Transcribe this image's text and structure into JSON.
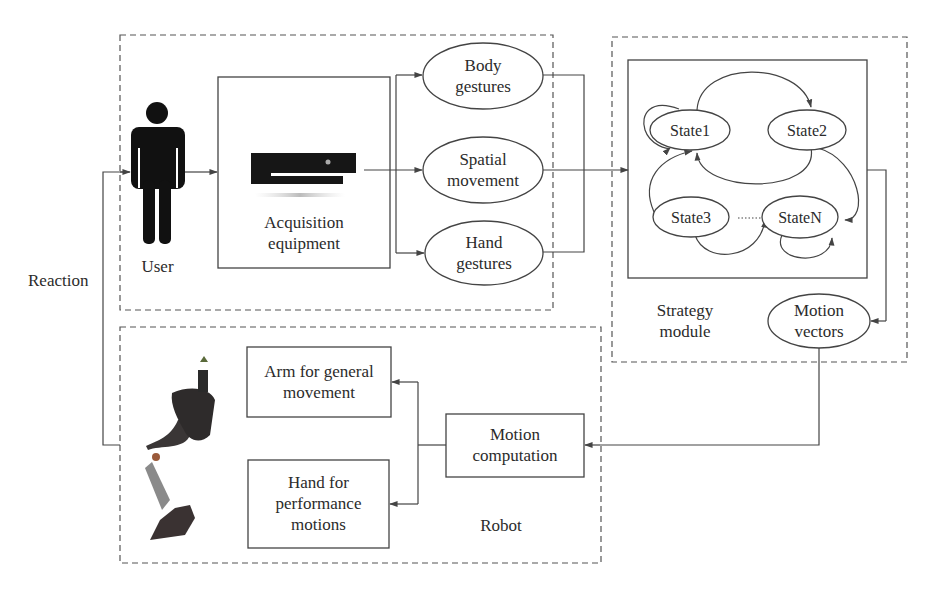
{
  "diagram": {
    "input_group": {
      "user_label": "User",
      "acquisition_label_line1": "Acquisition",
      "acquisition_label_line2": "equipment",
      "features": [
        {
          "line1": "Body",
          "line2": "gestures"
        },
        {
          "line1": "Spatial",
          "line2": "movement"
        },
        {
          "line1": "Hand",
          "line2": "gestures"
        }
      ]
    },
    "strategy_group": {
      "states": [
        "State1",
        "State2",
        "State3",
        "StateN"
      ],
      "ellipsis": "......",
      "label_line1": "Strategy",
      "label_line2": "module",
      "output_line1": "Motion",
      "output_line2": "vectors"
    },
    "robot_group": {
      "arm_line1": "Arm for general",
      "arm_line2": "movement",
      "hand_line1": "Hand for",
      "hand_line2": "performance",
      "hand_line3": "motions",
      "computation_line1": "Motion",
      "computation_line2": "computation",
      "label": "Robot"
    },
    "feedback_label": "Reaction",
    "colors": {
      "line": "#444444",
      "figure": "#111111",
      "background": "#ffffff"
    }
  }
}
